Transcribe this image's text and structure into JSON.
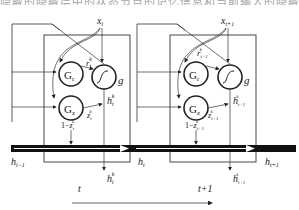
{
  "caption_fragment": "隐藏的隐藏层中的状态节点的记忆信息和当前输入的隐藏信息汇聚",
  "inputs": [
    "x_t",
    "x_{t+1}"
  ],
  "cells": [
    {
      "time_label": "t",
      "input": {
        "base": "x",
        "sub": "t"
      },
      "gate_r": {
        "base": "G",
        "sub": "r"
      },
      "gate_z": {
        "base": "G",
        "sub": "z"
      },
      "activation": "g",
      "r_label": {
        "base": "r",
        "sub": "t",
        "sup": "k"
      },
      "z_label": {
        "base": "z",
        "sub": "t",
        "sup": "k"
      },
      "one_minus_z": {
        "base": "1−z",
        "sub": "t",
        "sup": "k"
      },
      "h_candidate": {
        "base": "h",
        "sub": "t",
        "sup": "k"
      },
      "h_out": {
        "base": "h",
        "sub": "t",
        "sup": "k"
      }
    },
    {
      "time_label": "t+1",
      "input": {
        "base": "x",
        "sub": "t+1"
      },
      "gate_r": {
        "base": "G",
        "sub": "r"
      },
      "gate_z": {
        "base": "G",
        "sub": "z"
      },
      "activation": "g",
      "r_label": {
        "base": "r",
        "sub": "t+1",
        "sup": "k"
      },
      "z_label": {
        "base": "z",
        "sub": "t+1",
        "sup": "k"
      },
      "one_minus_z": {
        "base": "1−z",
        "sub": "t+1",
        "sup": "k"
      },
      "h_candidate": {
        "base": "h",
        "sub": "t+1",
        "sup": "k"
      },
      "h_out": {
        "base": "h",
        "sub": "t+1",
        "sup": "k"
      }
    }
  ],
  "hidden_states": [
    {
      "base": "h",
      "sub": "t−1"
    },
    {
      "base": "h",
      "sub": "t"
    },
    {
      "base": "h",
      "sub": "t+1"
    }
  ],
  "time_arrow": "time-axis"
}
